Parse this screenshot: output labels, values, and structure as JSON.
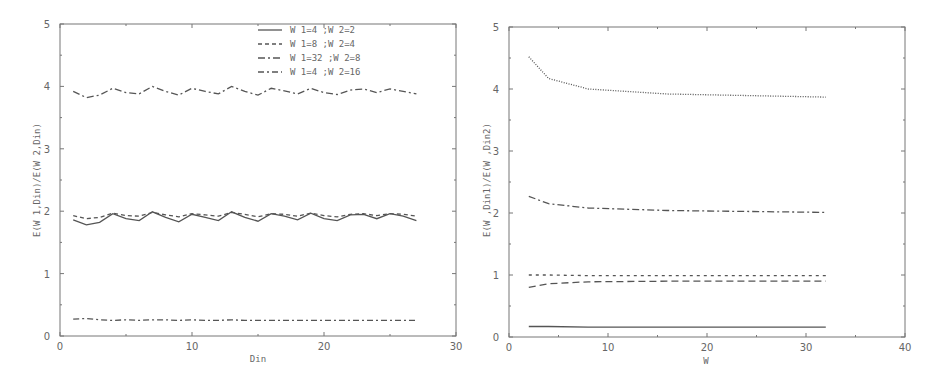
{
  "chart_data": [
    {
      "type": "line",
      "title": "",
      "xlabel": "Din",
      "ylabel": "E(W1,Din)/E(W2,Din)",
      "xlim": [
        0,
        30
      ],
      "ylim": [
        0,
        5
      ],
      "xticks": [
        "0",
        "10",
        "20",
        "30"
      ],
      "yticks": [
        "0",
        "1",
        "2",
        "3",
        "4",
        "5"
      ],
      "grid": false,
      "legend_position": "top-center",
      "x": [
        1,
        2,
        3,
        4,
        5,
        6,
        7,
        8,
        9,
        10,
        11,
        12,
        13,
        14,
        15,
        16,
        17,
        18,
        19,
        20,
        21,
        22,
        23,
        24,
        25,
        26,
        27
      ],
      "series": [
        {
          "name": "W1=4 ;W2=2",
          "style": "solid",
          "values": [
            1.86,
            1.78,
            1.82,
            1.96,
            1.88,
            1.85,
            1.99,
            1.9,
            1.83,
            1.95,
            1.9,
            1.85,
            1.99,
            1.9,
            1.84,
            1.96,
            1.92,
            1.86,
            1.97,
            1.88,
            1.85,
            1.94,
            1.95,
            1.88,
            1.96,
            1.92,
            1.85
          ]
        },
        {
          "name": "W1=8 ;W2=4",
          "style": "dashed",
          "values": [
            1.93,
            1.88,
            1.9,
            1.97,
            1.93,
            1.92,
            1.98,
            1.94,
            1.91,
            1.96,
            1.94,
            1.92,
            1.98,
            1.95,
            1.91,
            1.96,
            1.95,
            1.92,
            1.97,
            1.93,
            1.91,
            1.95,
            1.96,
            1.93,
            1.96,
            1.95,
            1.92
          ]
        },
        {
          "name": "W1=32 ;W2=8",
          "style": "dash-dot",
          "values": [
            3.92,
            3.82,
            3.86,
            3.97,
            3.9,
            3.88,
            4.0,
            3.92,
            3.86,
            3.97,
            3.92,
            3.88,
            4.0,
            3.92,
            3.86,
            3.97,
            3.93,
            3.88,
            3.97,
            3.9,
            3.87,
            3.94,
            3.96,
            3.9,
            3.96,
            3.92,
            3.88
          ]
        },
        {
          "name": "W1=4 ;W2=16",
          "style": "dash-dot-dot",
          "values": [
            0.27,
            0.28,
            0.26,
            0.25,
            0.26,
            0.25,
            0.26,
            0.26,
            0.25,
            0.26,
            0.25,
            0.25,
            0.26,
            0.25,
            0.25,
            0.25,
            0.25,
            0.25,
            0.25,
            0.25,
            0.25,
            0.25,
            0.25,
            0.25,
            0.25,
            0.25,
            0.25
          ]
        }
      ]
    },
    {
      "type": "line",
      "title": "",
      "xlabel": "W",
      "ylabel": "E(W,Din1)/E(W,Din2)",
      "xlim": [
        0,
        40
      ],
      "ylim": [
        0,
        5
      ],
      "xticks": [
        "0",
        "10",
        "20",
        "30",
        "40"
      ],
      "yticks": [
        "0",
        "1",
        "2",
        "3",
        "4",
        "5"
      ],
      "grid": false,
      "legend_position": "none",
      "x": [
        2,
        4,
        8,
        16,
        32
      ],
      "series": [
        {
          "name": "dotted",
          "style": "dotted",
          "values": [
            4.52,
            4.17,
            4.0,
            3.92,
            3.87
          ]
        },
        {
          "name": "dash-dot",
          "style": "dash-dot",
          "values": [
            2.27,
            2.15,
            2.08,
            2.04,
            2.01
          ]
        },
        {
          "name": "short-dashed",
          "style": "short-dashed",
          "values": [
            1.0,
            1.0,
            0.99,
            0.99,
            0.99
          ]
        },
        {
          "name": "long-dashed",
          "style": "long-dashed",
          "values": [
            0.8,
            0.86,
            0.89,
            0.9,
            0.9
          ]
        },
        {
          "name": "solid",
          "style": "solid",
          "values": [
            0.17,
            0.17,
            0.16,
            0.16,
            0.16
          ]
        }
      ]
    }
  ],
  "left_plot": {
    "xlabel": "Din",
    "ylabel": "E(W 1,Din)/E(W 2,Din)",
    "xticks": [
      "0",
      "10",
      "20",
      "30"
    ],
    "yticks": [
      "0",
      "1",
      "2",
      "3",
      "4",
      "5"
    ],
    "legend": [
      {
        "label": "W 1=4 ;W 2=2"
      },
      {
        "label": "W 1=8 ;W 2=4"
      },
      {
        "label": "W 1=32 ;W 2=8"
      },
      {
        "label": "W 1=4 ;W 2=16"
      }
    ]
  },
  "right_plot": {
    "xlabel": "W",
    "ylabel": "E(W ,Din1)/E(W ,Din2)",
    "xticks": [
      "0",
      "10",
      "20",
      "30",
      "40"
    ],
    "yticks": [
      "0",
      "1",
      "2",
      "3",
      "4",
      "5"
    ]
  },
  "colors": {
    "axis": "#777777",
    "series": "#555555",
    "text": "#666666"
  }
}
